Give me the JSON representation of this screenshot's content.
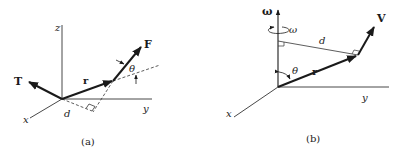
{
  "panels": [
    {
      "id": "a",
      "caption": "(a)",
      "axes": {
        "x": "x",
        "y": "y",
        "z": "z"
      },
      "vectors": {
        "torque": "T",
        "position": "r",
        "force": "F"
      },
      "angle": "θ",
      "distance": "d"
    },
    {
      "id": "b",
      "caption": "(b)",
      "axes": {
        "x": "x",
        "y": "y"
      },
      "vectors": {
        "angular_velocity": "ω",
        "position": "r",
        "velocity": "V"
      },
      "rotation_label": "ω",
      "angle": "θ",
      "distance": "d"
    }
  ]
}
